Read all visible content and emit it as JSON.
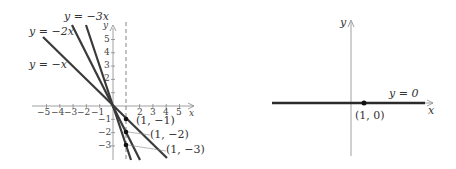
{
  "left_graph": {
    "title": "Lines through origin with negative slopes",
    "axes": {
      "x_label": "x",
      "y_label": "y",
      "x_ticks": [
        "-5",
        "-4",
        "-3",
        "-2",
        "-1",
        "1",
        "2",
        "3",
        "4",
        "5"
      ],
      "y_ticks_pos": [
        "1",
        "2",
        "3",
        "4",
        "5"
      ],
      "y_ticks_neg": [
        "-1",
        "-2",
        "-3"
      ]
    },
    "lines": [
      {
        "label": "y = -x",
        "slope": -1
      },
      {
        "label": "y = -2x",
        "slope": -2
      },
      {
        "label": "y = -3x",
        "slope": -3
      }
    ],
    "points": [
      {
        "label": "(1, -1)",
        "x": 1,
        "y": -1
      },
      {
        "label": "(1, -2)",
        "x": 1,
        "y": -2
      },
      {
        "label": "(1, -3)",
        "x": 1,
        "y": -3
      }
    ],
    "dashed_line": "x = 1"
  },
  "right_graph": {
    "axes": {
      "x_label": "x",
      "y_label": "y"
    },
    "line": {
      "label": "y = 0",
      "slope": 0
    },
    "point": {
      "label": "(1, 0)",
      "x": 1,
      "y": 0
    }
  },
  "colors": {
    "line": "#3a3a3a",
    "axis": "#888888",
    "text": "#333333"
  }
}
